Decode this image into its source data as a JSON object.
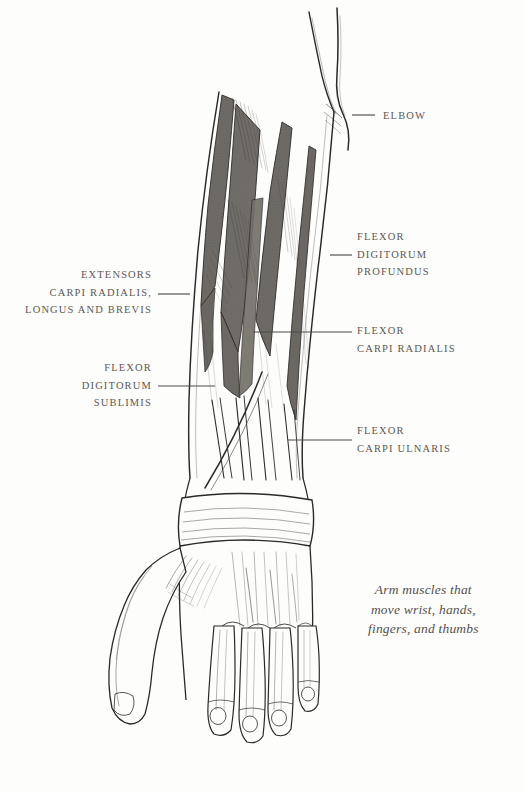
{
  "plate": {
    "background_color": "#fdfdfc",
    "ink_color": "#2b2926",
    "muscle_fill_color": "#6e6b67",
    "label_color": "#5d5852",
    "leader_color": "#4f4a45",
    "subject": "forearm-and-hand-anterior-view"
  },
  "labels": [
    {
      "name": "elbow",
      "side": "right",
      "lines": [
        "ELBOW"
      ],
      "text_x": 383,
      "text_y": 107,
      "leader": {
        "x1": 352,
        "y1": 115,
        "x2": 375,
        "y2": 115
      }
    },
    {
      "name": "flexor-digitorum-profundus",
      "side": "right",
      "lines": [
        "FLEXOR",
        "DIGITORUM",
        "PROFUNDUS"
      ],
      "text_x": 357,
      "text_y": 228,
      "leader": {
        "x1": 330,
        "y1": 255,
        "x2": 352,
        "y2": 255
      }
    },
    {
      "name": "flexor-carpi-radialis",
      "side": "right",
      "lines": [
        "FLEXOR",
        "CARPI RADIALIS"
      ],
      "text_x": 357,
      "text_y": 322,
      "leader": {
        "x1": 253,
        "y1": 332,
        "x2": 352,
        "y2": 332
      }
    },
    {
      "name": "flexor-carpi-ulnaris",
      "side": "right",
      "lines": [
        "FLEXOR",
        "CARPI ULNARIS"
      ],
      "text_x": 357,
      "text_y": 422,
      "leader": {
        "x1": 288,
        "y1": 440,
        "x2": 352,
        "y2": 440
      }
    },
    {
      "name": "extensors-carpi-radialis-longus-and-brevis",
      "side": "left",
      "lines": [
        "EXTENSORS",
        "CARPI RADIALIS,",
        "LONGUS AND BREVIS"
      ],
      "text_right_x": 152,
      "text_y": 266,
      "leader": {
        "x1": 158,
        "y1": 294,
        "x2": 190,
        "y2": 294
      }
    },
    {
      "name": "flexor-digitorum-sublimis",
      "side": "left",
      "lines": [
        "FLEXOR",
        "DIGITORUM",
        "SUBLIMIS"
      ],
      "text_right_x": 152,
      "text_y": 359,
      "leader": {
        "x1": 158,
        "y1": 386,
        "x2": 215,
        "y2": 386
      }
    }
  ],
  "caption": {
    "name": "plate-caption",
    "lines": [
      "Arm muscles that",
      "move wrist, hands,",
      "fingers, and thumbs"
    ],
    "x": 368,
    "y": 580
  }
}
